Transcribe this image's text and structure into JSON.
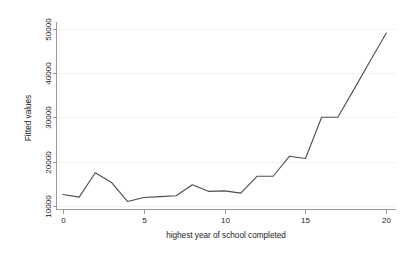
{
  "chart_data": {
    "type": "line",
    "title": "",
    "subtitle": "",
    "xlabel": "highest year of school completed",
    "ylabel": "Fitted values",
    "xlim": [
      -0.4,
      20.6
    ],
    "ylim": [
      9200,
      51500
    ],
    "xticks": [
      0,
      5,
      10,
      15,
      20
    ],
    "xtick_labels": [
      "0",
      "5",
      "10",
      "15",
      "20"
    ],
    "yticks": [
      10000,
      20000,
      30000,
      40000,
      50000
    ],
    "ytick_labels": [
      "10000",
      "20000",
      "30000",
      "40000",
      "50000"
    ],
    "grid": "horizontal",
    "legend": "none",
    "x": [
      0,
      1,
      2,
      3,
      4,
      5,
      6,
      7,
      8,
      9,
      10,
      11,
      12,
      13,
      14,
      15,
      16,
      17,
      18,
      19,
      20
    ],
    "series": [
      {
        "name": "Fitted values",
        "color": "#4d4d4d",
        "values": [
          12600,
          12000,
          17500,
          15300,
          11000,
          11900,
          12100,
          12300,
          14800,
          13300,
          13400,
          12900,
          16700,
          16700,
          21200,
          20700,
          30000,
          30000,
          36300,
          42700,
          49000
        ]
      }
    ]
  },
  "axis_labels": {
    "x_title": "highest year of school completed",
    "y_title": "Fitted values"
  },
  "colors": {
    "line": "#4d4d4d",
    "axis": "#9a9a9a",
    "grid": "#f2f2f2",
    "background": "#ffffff",
    "text": "#1a1a1a"
  }
}
